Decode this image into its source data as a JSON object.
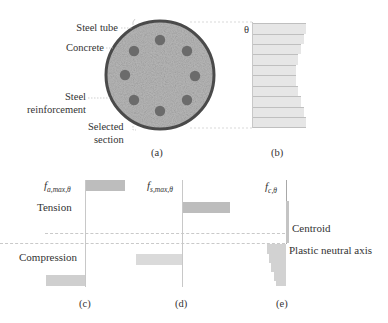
{
  "panel_a": {
    "labels": {
      "steel_tube": "Steel tube",
      "concrete": "Concrete",
      "steel_reinforcement_1": "Steel",
      "steel_reinforcement_2": "reinforcement",
      "selected_section_1": "Selected",
      "selected_section_2": "section"
    },
    "caption": "(a)",
    "rebar_count": 8
  },
  "panel_b": {
    "theta_label": "θ",
    "caption": "(b)",
    "strip_count": 10
  },
  "panel_c": {
    "stress_label": "f",
    "stress_sub": "a,max,θ",
    "tension_label": "Tension",
    "compression_label": "Compression",
    "caption": "(c)"
  },
  "panel_d": {
    "stress_label": "f",
    "stress_sub": "s,max,θ",
    "caption": "(d)"
  },
  "panel_e": {
    "stress_label": "f",
    "stress_sub": "c,θ",
    "centroid_label": "Centroid",
    "pna_label": "Plastic neutral axis",
    "caption": "(e)"
  },
  "colors": {
    "tube": "#4a4a4a",
    "concrete": "#b5b5b5",
    "rebar": "#6a6a6a",
    "bar_fill": "#cfcfcf",
    "strip_fill": "#e6e6e6"
  }
}
